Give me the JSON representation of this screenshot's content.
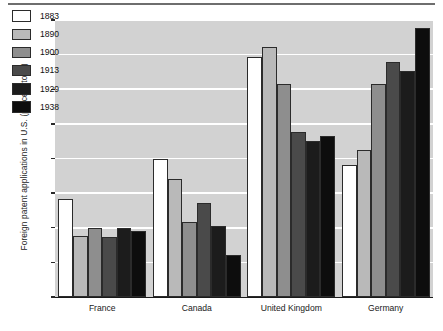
{
  "chart_data": {
    "type": "bar",
    "title": "",
    "subtitle": "",
    "xlabel": "",
    "ylabel": "Foreign patent applications in U.S. (percent total)",
    "categories": [
      "France",
      "Canada",
      "United Kingdom",
      "Germany"
    ],
    "ylim": [
      0,
      40
    ],
    "yticks": [
      0,
      5,
      10,
      15,
      20,
      25,
      30,
      35,
      40
    ],
    "ytick_labels": [
      "0",
      "5",
      "10",
      "15",
      "20",
      "25",
      "30",
      "35",
      "40"
    ],
    "grid": "horizontal",
    "legend_position": "upper-left-inside",
    "series": [
      {
        "name": "1883",
        "color": "#ffffff",
        "values": [
          14.2,
          20.0,
          34.6,
          19.1
        ]
      },
      {
        "name": "1890",
        "color": "#b9b9b9",
        "values": [
          8.8,
          17.1,
          36.1,
          21.2
        ]
      },
      {
        "name": "1900",
        "color": "#8e8e8e",
        "values": [
          9.9,
          10.9,
          30.7,
          30.8
        ]
      },
      {
        "name": "1913",
        "color": "#4a4a4a",
        "values": [
          8.6,
          13.6,
          23.8,
          33.9
        ]
      },
      {
        "name": "1929",
        "color": "#1c1c1c",
        "values": [
          9.9,
          10.3,
          22.5,
          32.6
        ]
      },
      {
        "name": "1938",
        "color": "#0d0d0d",
        "values": [
          9.5,
          6.0,
          23.3,
          38.8
        ]
      }
    ]
  },
  "axis": {
    "y_title": "Foreign patent applications in U.S. (percent total)"
  }
}
